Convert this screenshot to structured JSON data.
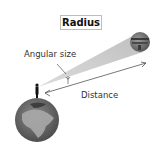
{
  "title": "Radius",
  "labels": {
    "angular_size": "Angular size",
    "distance": "Distance"
  },
  "icons": [
    "earth",
    "observer-person",
    "distant-planet",
    "distance-arrow",
    "angle-arrow"
  ],
  "colors": {
    "cone": "#c8c8c8",
    "earth_ocean": "#6e6e6e",
    "earth_land": "#a8a8a8",
    "planet": "#7a7a7a",
    "line": "#555555"
  }
}
